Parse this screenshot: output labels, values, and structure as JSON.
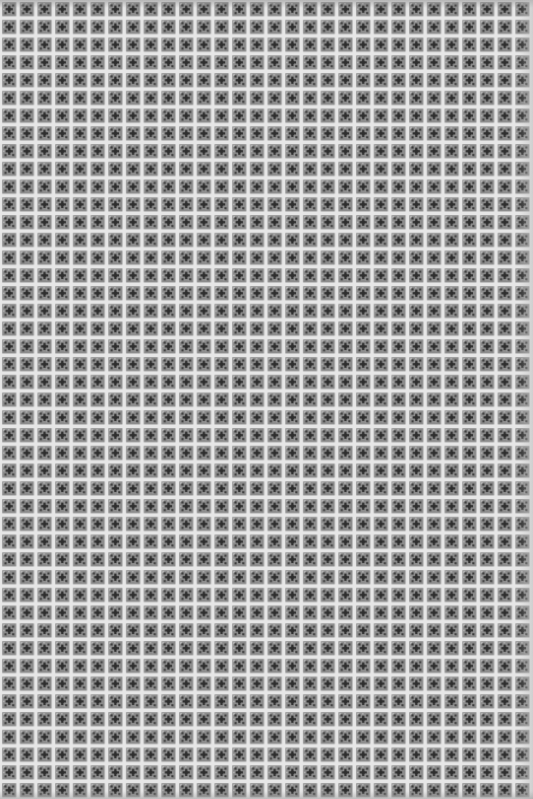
{
  "image": {
    "description": "Grayscale close-up photograph of a repeating square tile/mesh pattern: each cell has a dark cross-shaped motif surrounded by four dark dots on a speckled mid-gray ground, separated by light gridlines.",
    "palette": {
      "gridline": "#e6e6e6",
      "cell_ground": "#8c8c8c",
      "speckle_light": "#b4b4b4",
      "motif_dark": "#2e2e2e",
      "dot_dark": "#3a3a3a"
    },
    "pattern": {
      "columns": 30,
      "rows": 45,
      "motif": "cross-with-four-dots"
    }
  }
}
